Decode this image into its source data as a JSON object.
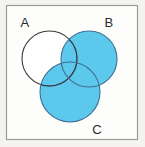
{
  "figure": {
    "name": "three-set-venn-diagram",
    "background_color": "#f4f3f1",
    "shaded_color": "#5bc8ec",
    "shaded_stroke_color": "#3f6f93",
    "unshaded_fill_color": "#ffffff",
    "outline_color": "#3a3a3a",
    "frame": {
      "border_color": "#9a9a98",
      "fill_color": "#fdfdfc",
      "x": 6,
      "y": 5,
      "width": 132,
      "height": 135
    }
  },
  "sets": [
    {
      "id": "A",
      "label": "A",
      "shaded": false,
      "fill": "#ffffff",
      "cx": 49.5,
      "cy": 58.5,
      "r": 27.5,
      "label_x": 25,
      "label_y": 27
    },
    {
      "id": "B",
      "label": "B",
      "shaded": true,
      "fill": "#5bc8ec",
      "cx": 89,
      "cy": 59,
      "r": 28,
      "label_x": 109,
      "label_y": 27
    },
    {
      "id": "C",
      "label": "C",
      "shaded": true,
      "fill": "#5bc8ec",
      "cx": 70,
      "cy": 92,
      "r": 30,
      "label_x": 97,
      "label_y": 134
    }
  ],
  "shading": {
    "expression": "B ∪ C",
    "shaded_regions": [
      "B only",
      "C only",
      "A ∩ B",
      "A ∩ C",
      "B ∩ C",
      "A ∩ B ∩ C"
    ],
    "unshaded_regions": [
      "A only",
      "outside all circles"
    ]
  }
}
